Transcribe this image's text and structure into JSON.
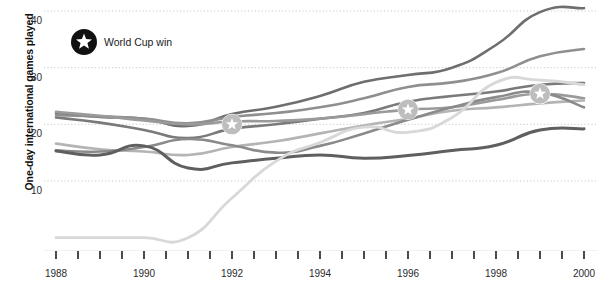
{
  "chart_data": {
    "type": "line",
    "title": "",
    "xlabel": "",
    "ylabel": "One-day international games played",
    "xlim": [
      1988,
      2000
    ],
    "ylim": [
      0,
      42
    ],
    "yticks": [
      10,
      20,
      30,
      40
    ],
    "ytick_labels": [
      "10",
      "20",
      "30",
      "40"
    ],
    "xticks": [
      1988,
      1989,
      1990,
      1991,
      1992,
      1993,
      1994,
      1995,
      1996,
      1997,
      1998,
      1999,
      2000
    ],
    "xtick_labels": [
      "1988",
      "",
      "1990",
      "",
      "1992",
      "",
      "1994",
      "",
      "1996",
      "",
      "1998",
      "",
      "2000"
    ],
    "xtick_labels_shown": [
      "1988",
      "1990",
      "1992",
      "1994",
      "1996",
      "1998",
      "2000"
    ],
    "minor_xticks_every": 0.5,
    "grid": "horizontal-dotted",
    "legend_position": "top-left-inside",
    "x": [
      1988,
      1989,
      1990,
      1991,
      1992,
      1993,
      1994,
      1995,
      1996,
      1997,
      1998,
      1999,
      2000
    ],
    "series": [
      {
        "name": "series-1",
        "color": "#6e6e6e",
        "width": 2.6,
        "values": [
          22.0,
          21.3,
          21.0,
          19.7,
          21.8,
          23.1,
          25.0,
          27.5,
          28.7,
          30.0,
          34.0,
          39.8,
          40.5
        ]
      },
      {
        "name": "series-2",
        "color": "#8f8f8f",
        "width": 2.6,
        "values": [
          21.6,
          21.4,
          21.0,
          20.2,
          21.3,
          22.0,
          23.0,
          24.6,
          26.6,
          27.4,
          29.0,
          32.0,
          33.3
        ]
      },
      {
        "name": "series-3",
        "color": "#7a7a7a",
        "width": 2.6,
        "values": [
          21.2,
          20.3,
          19.0,
          17.6,
          19.2,
          20.0,
          21.0,
          22.0,
          24.0,
          25.0,
          25.8,
          27.0,
          27.3
        ]
      },
      {
        "name": "series-4",
        "color": "#9a9a9a",
        "width": 2.6,
        "values": [
          22.2,
          21.5,
          20.7,
          20.0,
          20.5,
          20.6,
          21.0,
          21.8,
          22.6,
          23.0,
          24.3,
          25.4,
          24.6
        ]
      },
      {
        "name": "series-5",
        "color": "#b4b4b4",
        "width": 2.6,
        "values": [
          16.6,
          15.6,
          15.2,
          14.6,
          16.0,
          17.0,
          18.4,
          19.8,
          21.0,
          22.4,
          23.0,
          23.7,
          24.2
        ]
      },
      {
        "name": "series-6",
        "color": "#8a8a8a",
        "width": 2.6,
        "values": [
          15.4,
          15.2,
          16.0,
          17.4,
          16.3,
          15.0,
          16.2,
          18.4,
          20.8,
          23.0,
          24.8,
          25.6,
          23.0
        ]
      },
      {
        "name": "series-7",
        "color": "#5f5f5f",
        "width": 3.0,
        "values": [
          15.3,
          14.6,
          16.2,
          12.3,
          13.2,
          14.0,
          14.6,
          14.0,
          14.5,
          15.4,
          16.3,
          19.0,
          19.2
        ]
      },
      {
        "name": "series-8",
        "color": "#d8d8d8",
        "width": 2.8,
        "values": [
          0.0,
          0.0,
          0.0,
          0.0,
          7.0,
          13.5,
          16.8,
          19.5,
          18.6,
          21.2,
          27.4,
          27.8,
          27.0
        ]
      }
    ],
    "markers": [
      {
        "label": "World Cup win",
        "x": 1992,
        "y": 20.0
      },
      {
        "label": "World Cup win",
        "x": 1996,
        "y": 22.6
      },
      {
        "label": "World Cup win",
        "x": 1999,
        "y": 25.4
      }
    ],
    "legend": [
      {
        "label": "World Cup win",
        "icon": "star-in-circle",
        "color": "#111111"
      }
    ]
  }
}
